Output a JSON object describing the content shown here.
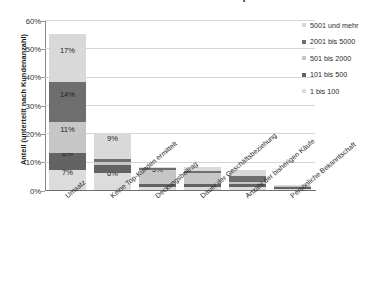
{
  "chart_data": {
    "type": "bar",
    "subtype": "stacked-bar",
    "title": "Anhand welchem Kriterium ermitteln Sie Ihre Top-Kunden?",
    "xlabel": "",
    "ylabel": "Anteil (unterteilt nach Kundenanzahl)",
    "ylim": [
      0,
      60
    ],
    "yunit": "%",
    "ytick_labels": [
      "0%",
      "10%",
      "20%",
      "30%",
      "40%",
      "50%",
      "60%"
    ],
    "ytick_values": [
      0,
      10,
      20,
      30,
      40,
      50,
      60
    ],
    "grid": true,
    "legend_position": "right",
    "categories": [
      "Umsatz",
      "Keine Top-Kunden ermittelt",
      "Deckungsbeitrag",
      "Dauer der Geschäftsbeziehung",
      "Anzahl der bisherigen Käufe",
      "Persönliche Bekanntschaft"
    ],
    "series": [
      {
        "name": "1 bis 100",
        "color": "#dcdcdc",
        "values": [
          7,
          6,
          1,
          1,
          1,
          0.4
        ],
        "labels": [
          "7%",
          "6%",
          "",
          "",
          "",
          ""
        ]
      },
      {
        "name": "101 bis 500",
        "color": "#636363",
        "values": [
          6,
          3,
          1,
          1,
          1,
          0.5
        ],
        "labels": [
          "6%",
          "3%",
          "",
          "",
          "",
          ""
        ]
      },
      {
        "name": "501 bis 2000",
        "color": "#c6c6c6",
        "values": [
          11,
          1,
          5,
          4,
          1,
          0.4
        ],
        "labels": [
          "11%",
          "",
          "5%",
          "4%",
          "",
          ""
        ]
      },
      {
        "name": "2001 bis 5000",
        "color": "#6e6e6e",
        "values": [
          14,
          1,
          0.6,
          0.6,
          2,
          0.3
        ],
        "labels": [
          "14%",
          "",
          "",
          "",
          "",
          ""
        ]
      },
      {
        "name": "5001 und mehr",
        "color": "#d9d9d9",
        "values": [
          17,
          9,
          0.5,
          1.5,
          2,
          0.3
        ],
        "labels": [
          "17%",
          "9%",
          "",
          "",
          "",
          ""
        ]
      }
    ],
    "totals": [
      55,
      20,
      8.1,
      8.1,
      7,
      1.9
    ],
    "colors": {
      "grid": "#d6d6d6",
      "axis": "#6f6f6f",
      "text": "#242424",
      "background": "#ffffff"
    }
  },
  "legend": {
    "items": [
      {
        "label": "5001 und mehr",
        "color": "#d9d9d9"
      },
      {
        "label": "2001 bis 5000",
        "color": "#6e6e6e"
      },
      {
        "label": "501 bis 2000",
        "color": "#c6c6c6"
      },
      {
        "label": "101 bis 500",
        "color": "#636363"
      },
      {
        "label": "1 bis 100",
        "color": "#dcdcdc"
      }
    ]
  }
}
